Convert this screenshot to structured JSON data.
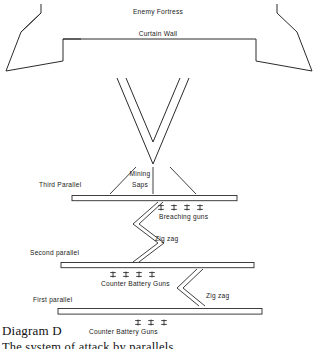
{
  "diagram": {
    "caption_title": "Diagram D",
    "caption_subtitle": "The system of attack by parallels",
    "labels": {
      "enemy_fortress": "Enemy Fortress",
      "curtain_wall": "Curtain Wall",
      "third_parallel": "Third Parallel",
      "mining_saps_line1": "Mining",
      "mining_saps_line2": "Saps",
      "breaching_guns": "Breaching guns",
      "zig_zag_upper": "Zig zag",
      "second_parallel": "Second parallel",
      "counter_battery_guns_second": "Counter Battery Guns",
      "zig_zag_lower": "Zig zag",
      "first_parallel": "First parallel",
      "counter_battery_guns_first": "Counter Battery Guns"
    },
    "gun_counts": {
      "breaching_guns": 4,
      "counter_battery_guns_second": 4,
      "counter_battery_guns_first": 3
    },
    "colors": {
      "line": "#2b2b2b",
      "text": "#1a1a1a",
      "background": "#ffffff"
    }
  }
}
